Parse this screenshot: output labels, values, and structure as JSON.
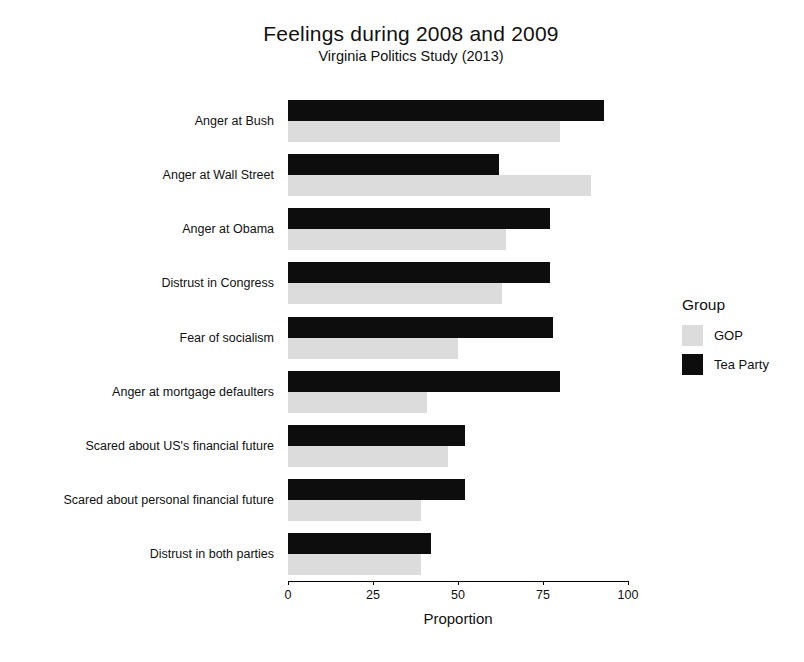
{
  "chart_data": {
    "type": "bar",
    "orientation": "horizontal",
    "title": "Feelings during 2008 and 2009",
    "subtitle": "Virginia Politics Study (2013)",
    "xlabel": "Proportion",
    "ylabel": "",
    "xlim": [
      0,
      100
    ],
    "xticks": [
      0,
      25,
      50,
      75,
      100
    ],
    "xtick_labels": [
      "0",
      "25",
      "50",
      "75",
      "100"
    ],
    "grid": false,
    "legend_title": "Group",
    "legend_position": "right",
    "categories": [
      "Anger at Bush",
      "Anger at Wall Street",
      "Anger at Obama",
      "Distrust in Congress",
      "Fear of socialism",
      "Anger at mortgage defaulters",
      "Scared about US's financial future",
      "Scared about personal financial future",
      "Distrust in both parties"
    ],
    "series": [
      {
        "name": "Tea Party",
        "color": "#0d0d0d",
        "values": [
          93,
          62,
          77,
          77,
          78,
          80,
          52,
          52,
          42
        ]
      },
      {
        "name": "GOP",
        "color": "#dcdcdc",
        "values": [
          80,
          89,
          64,
          63,
          50,
          41,
          47,
          39,
          39
        ]
      }
    ]
  },
  "legend": {
    "title": "Group",
    "items": [
      {
        "label": "GOP",
        "color": "#dcdcdc"
      },
      {
        "label": "Tea Party",
        "color": "#0d0d0d"
      }
    ]
  }
}
